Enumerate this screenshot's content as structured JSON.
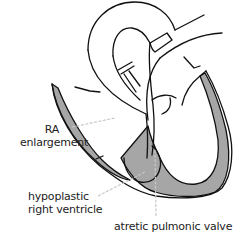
{
  "diagram": {
    "colors": {
      "outline": "#111111",
      "wall_fill": "#a6a6a6",
      "leader_line": "#c8c8c8",
      "text": "#222222",
      "background": "#ffffff"
    },
    "labels": [
      {
        "id": "ra-enlargement",
        "lines": [
          "RA",
          "enlargement"
        ]
      },
      {
        "id": "hypoplastic-right-ventricle",
        "lines": [
          "hypoplastic",
          "right ventricle"
        ]
      },
      {
        "id": "atretic-pulmonic-valve",
        "lines": [
          "atretic pulmonic valve"
        ]
      }
    ]
  }
}
